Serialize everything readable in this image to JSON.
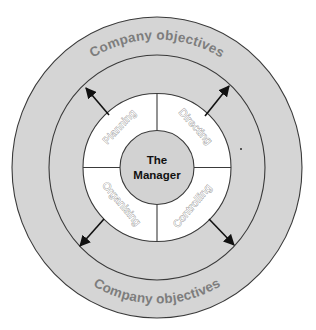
{
  "diagram": {
    "type": "concentric-circle",
    "center": {
      "label_line1": "The",
      "label_line2": "Manager"
    },
    "quadrants": [
      {
        "id": "planning",
        "label": "Planning",
        "position": "top-left"
      },
      {
        "id": "directing",
        "label": "Directing",
        "position": "top-right"
      },
      {
        "id": "organising",
        "label": "Organising",
        "position": "bottom-left"
      },
      {
        "id": "controlling",
        "label": "Controlling",
        "position": "bottom-right"
      }
    ],
    "outer_ring": {
      "top_label": "Company objectives",
      "bottom_label": "Company objectives"
    },
    "arrows": [
      {
        "direction": "outward",
        "position": "top-left"
      },
      {
        "direction": "outward",
        "position": "top-right"
      },
      {
        "direction": "outward",
        "position": "bottom-left"
      },
      {
        "direction": "outward",
        "position": "bottom-right"
      }
    ],
    "colors": {
      "ring_fill": "#d5d5d5",
      "inner_ring_fill": "#ffffff",
      "core_fill": "#d2d2d2",
      "outline": "#3a3a3a",
      "outer_text": "#7d7d7d",
      "arrow": "#111111"
    }
  }
}
